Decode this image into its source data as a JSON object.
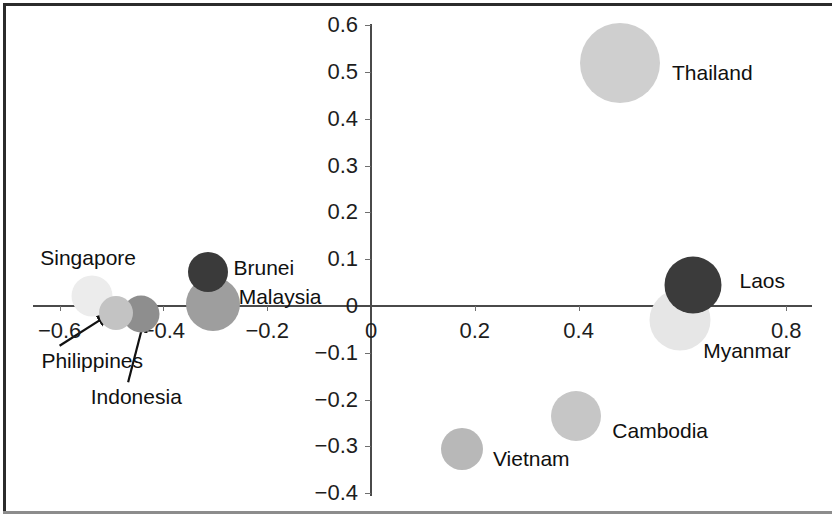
{
  "chart_data": {
    "type": "scatter",
    "title": "",
    "subtitle": "",
    "xlabel": "",
    "ylabel": "",
    "xlim": [
      -0.7,
      0.85
    ],
    "ylim": [
      -0.4,
      0.6
    ],
    "grid": false,
    "legend": "none",
    "bubble_note": "Bubble area encodes a third (unlabeled) magnitude; marker fill greys differ per country.",
    "xticks": [
      "−0.6",
      "−0.4",
      "−0.2",
      "0",
      "0.2",
      "0.4",
      "0.6",
      "0.8"
    ],
    "xtick_values": [
      -0.6,
      -0.4,
      -0.2,
      0,
      0.2,
      0.4,
      0.6,
      0.8
    ],
    "yticks": [
      "0.6",
      "0.5",
      "0.4",
      "0.3",
      "0.2",
      "0.1",
      "0",
      "−0.1",
      "−0.2",
      "−0.3",
      "−0.4"
    ],
    "ytick_values": [
      0.6,
      0.5,
      0.4,
      0.3,
      0.2,
      0.1,
      0,
      -0.1,
      -0.2,
      -0.3,
      -0.4
    ],
    "axis_origin_label": "0",
    "points": [
      {
        "label": "Thailand",
        "x": 0.48,
        "y": 0.52,
        "size": 80,
        "color": "#cfcfcf",
        "label_x": 0.58,
        "label_y": 0.5,
        "anchor": "left",
        "leader": false
      },
      {
        "label": "Laos",
        "x": 0.62,
        "y": 0.045,
        "size": 57,
        "color": "#3b3b3b",
        "label_x": 0.71,
        "label_y": 0.055,
        "anchor": "left",
        "leader": false
      },
      {
        "label": "Myanmar",
        "x": 0.595,
        "y": -0.03,
        "size": 61,
        "color": "#e6e6e6",
        "label_x": 0.64,
        "label_y": -0.095,
        "anchor": "left",
        "leader": false
      },
      {
        "label": "Cambodia",
        "x": 0.395,
        "y": -0.235,
        "size": 50,
        "color": "#c6c6c6",
        "label_x": 0.465,
        "label_y": -0.265,
        "anchor": "left",
        "leader": false
      },
      {
        "label": "Vietnam",
        "x": 0.175,
        "y": -0.305,
        "size": 42,
        "color": "#b8b8b8",
        "label_x": 0.235,
        "label_y": -0.325,
        "anchor": "left",
        "leader": false
      },
      {
        "label": "Brunei",
        "x": -0.315,
        "y": 0.072,
        "size": 40,
        "color": "#3a3a3a",
        "label_x": -0.265,
        "label_y": 0.083,
        "anchor": "left",
        "leader": false
      },
      {
        "label": "Malaysia",
        "x": -0.305,
        "y": 0.005,
        "size": 54,
        "color": "#9e9e9e",
        "label_x": -0.255,
        "label_y": 0.022,
        "anchor": "left",
        "leader": false
      },
      {
        "label": "Singapore",
        "x": -0.537,
        "y": 0.022,
        "size": 41,
        "color": "#ececec",
        "label_x": -0.545,
        "label_y": 0.105,
        "anchor": "center",
        "leader": false
      },
      {
        "label": "Philippines",
        "x": -0.492,
        "y": -0.016,
        "size": 34,
        "color": "#c3c3c3",
        "label_x": -0.635,
        "label_y": -0.115,
        "anchor": "left",
        "leader": true,
        "leader_from": [
          -0.6,
          -0.085
        ],
        "leader_to": [
          -0.505,
          -0.018
        ]
      },
      {
        "label": "Indonesia",
        "x": -0.443,
        "y": -0.018,
        "size": 37,
        "color": "#8e8e8e",
        "label_x": -0.54,
        "label_y": -0.193,
        "anchor": "left",
        "leader": true,
        "leader_from": [
          -0.468,
          -0.163
        ],
        "leader_to": [
          -0.437,
          -0.03
        ]
      }
    ]
  },
  "axes": {
    "x_tick_labels": [
      "−0.6",
      "−0.4",
      "−0.2",
      "0",
      "0.2",
      "0.4",
      "0.6",
      "0.8"
    ],
    "y_tick_labels": [
      "0.6",
      "0.5",
      "0.4",
      "0.3",
      "0.2",
      "0.1",
      "0",
      "−0.1",
      "−0.2",
      "−0.3",
      "−0.4"
    ],
    "origin_x_label": "0"
  },
  "colors": {
    "axis": "#4a4a4a",
    "frame": "#2b2b2b",
    "text": "#101010",
    "background": "#ffffff"
  }
}
